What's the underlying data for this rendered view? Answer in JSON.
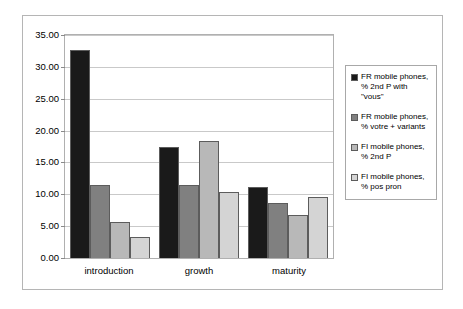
{
  "chart_data": {
    "type": "bar",
    "title": "",
    "subtitle": "",
    "xlabel": "",
    "ylabel": "",
    "categories": [
      "introduction",
      "growth",
      "maturity"
    ],
    "ylim": [
      0,
      35
    ],
    "ytick_step": 5,
    "ytick_labels": [
      "0.00",
      "5.00",
      "10.00",
      "15.00",
      "20.00",
      "25.00",
      "30.00",
      "35.00"
    ],
    "grid": true,
    "legend_position": "right",
    "series": [
      {
        "name": "FR mobile phones,\n% 2nd P with \"vous\"",
        "color": "#1a1a1a",
        "values": [
          32.7,
          17.4,
          11.1
        ]
      },
      {
        "name": "FR mobile phones,\n% votre + variants",
        "color": "#808080",
        "values": [
          11.4,
          11.5,
          8.7
        ]
      },
      {
        "name": "FI mobile phones,\n% 2nd P",
        "color": "#b8b8b8",
        "values": [
          5.7,
          18.3,
          6.8
        ]
      },
      {
        "name": "FI mobile phones,\n% pos pron",
        "color": "#d4d4d4",
        "values": [
          3.3,
          10.3,
          9.6
        ]
      }
    ]
  }
}
